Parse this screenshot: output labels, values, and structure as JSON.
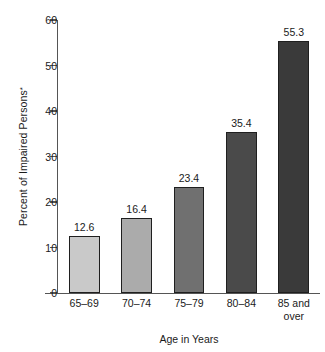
{
  "chart_data": {
    "type": "bar",
    "title": "",
    "subtitle": "",
    "categories": [
      "65–69",
      "70–74",
      "75–79",
      "80–84",
      "85 and over"
    ],
    "category_lines": [
      [
        "65–69"
      ],
      [
        "70–74"
      ],
      [
        "75–79"
      ],
      [
        "80–84"
      ],
      [
        "85 and",
        "over"
      ]
    ],
    "values": [
      12.6,
      16.4,
      23.4,
      35.4,
      55.3
    ],
    "value_labels": [
      "12.6",
      "16.4",
      "23.4",
      "35.4",
      "55.3"
    ],
    "xlabel": "Age in Years",
    "ylabel": "Percent of Impaired Persons",
    "ylabel_footnote_marker": "*",
    "ylim": [
      0,
      60
    ],
    "yticks": [
      0,
      10,
      20,
      30,
      40,
      50,
      60
    ],
    "ytick_labels": [
      "0",
      "10",
      "20",
      "30",
      "40",
      "50",
      "60"
    ],
    "grid": false,
    "legend": null,
    "bar_colors": [
      "#c9c9c9",
      "#ababab",
      "#707070",
      "#4a4a4a",
      "#3a3a3a"
    ],
    "bar_outline_color": "#1f1f1f",
    "axis_color": "#555555",
    "background_color": "#ffffff"
  }
}
